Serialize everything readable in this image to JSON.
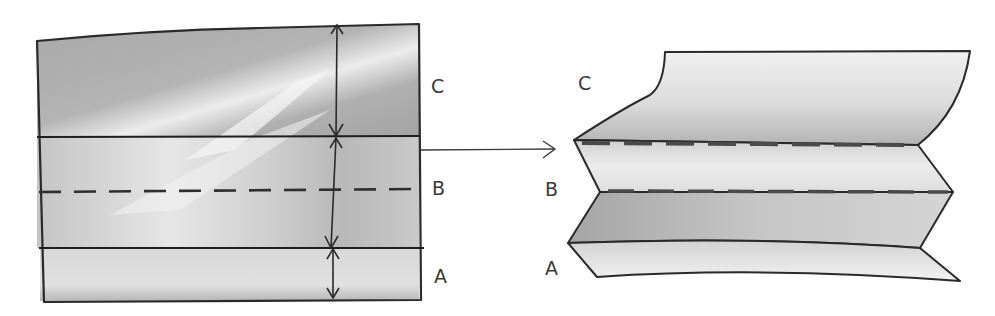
{
  "figure": {
    "type": "folding-diagram",
    "left_panel": {
      "description": "flat sheet divided into three bands",
      "labels": {
        "top": "C",
        "middle": "B",
        "bottom": "A"
      },
      "lines": [
        "solid fold line between C and B",
        "dashed fold line through B",
        "solid fold line between B and A"
      ]
    },
    "arrow": {
      "direction": "right"
    },
    "right_panel": {
      "description": "sheet pleated along the fold lines",
      "labels": {
        "top": "C",
        "middle": "B",
        "bottom": "A"
      }
    },
    "colors": {
      "ink": "#2a2a2a",
      "paper_dark": "#a9a9a9",
      "paper_mid": "#c4c4c4",
      "paper_light": "#e8e8e8",
      "background": "#ffffff"
    }
  }
}
